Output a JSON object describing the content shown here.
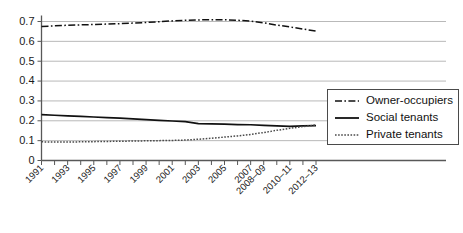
{
  "chart_data": {
    "type": "line",
    "title": "",
    "subtitle": "",
    "xlabel": "",
    "ylabel": "",
    "ylim": [
      0,
      0.7
    ],
    "grid": true,
    "legend_position": "right",
    "y_ticks": [
      "0",
      "0.1",
      "0.2",
      "0.3",
      "0.4",
      "0.5",
      "0.6",
      "0.7"
    ],
    "y_tick_values": [
      0,
      0.1,
      0.2,
      0.3,
      0.4,
      0.5,
      0.6,
      0.7
    ],
    "categories": [
      "1991",
      "1992",
      "1993",
      "1994",
      "1995",
      "1996",
      "1997",
      "1998",
      "1999",
      "2000",
      "2001",
      "2002",
      "2003",
      "2004",
      "2005",
      "2006",
      "2007",
      "2008-09",
      "2009-10",
      "2010-11",
      "2011-12",
      "2012-13"
    ],
    "x_tick_labels": [
      "1991",
      "1993",
      "1995",
      "1997",
      "1999",
      "2001",
      "2003",
      "2005",
      "2007",
      "2008–09",
      "2010–11",
      "2012–13"
    ],
    "series": [
      {
        "name": "Owner-occupiers",
        "style": "dash-dot",
        "values": [
          0.675,
          0.678,
          0.681,
          0.683,
          0.685,
          0.687,
          0.689,
          0.692,
          0.695,
          0.699,
          0.703,
          0.706,
          0.708,
          0.709,
          0.709,
          0.706,
          0.702,
          0.693,
          0.682,
          0.673,
          0.662,
          0.652
        ]
      },
      {
        "name": "Social tenants",
        "style": "solid",
        "values": [
          0.231,
          0.228,
          0.225,
          0.222,
          0.219,
          0.216,
          0.213,
          0.21,
          0.206,
          0.202,
          0.199,
          0.196,
          0.186,
          0.184,
          0.183,
          0.181,
          0.18,
          0.177,
          0.174,
          0.172,
          0.174,
          0.176
        ]
      },
      {
        "name": "Private tenants",
        "style": "dotted",
        "values": [
          0.094,
          0.093,
          0.093,
          0.094,
          0.095,
          0.096,
          0.097,
          0.098,
          0.099,
          0.1,
          0.101,
          0.103,
          0.107,
          0.112,
          0.118,
          0.124,
          0.131,
          0.141,
          0.152,
          0.162,
          0.171,
          0.179
        ]
      }
    ]
  },
  "legend": {
    "items": [
      {
        "label": "Owner-occupiers",
        "style": "dash-dot"
      },
      {
        "label": "Social tenants",
        "style": "solid"
      },
      {
        "label": "Private tenants",
        "style": "dotted"
      }
    ]
  },
  "colors": {
    "series_line": "#111111",
    "private_line": "#4a4a4a",
    "grid": "#b9b9b9",
    "axis": "#585858",
    "background": "#ffffff"
  }
}
